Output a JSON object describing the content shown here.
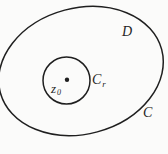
{
  "figure": {
    "colors": {
      "stroke": "#1f1f1f",
      "background": "#fbfbfa",
      "label": "#1f1f1f"
    },
    "labels": {
      "domain": "D",
      "outer_curve": "C",
      "inner_curve": {
        "base": "C",
        "sub": "r"
      },
      "center_point": {
        "base": "z",
        "sub": "0"
      }
    }
  }
}
